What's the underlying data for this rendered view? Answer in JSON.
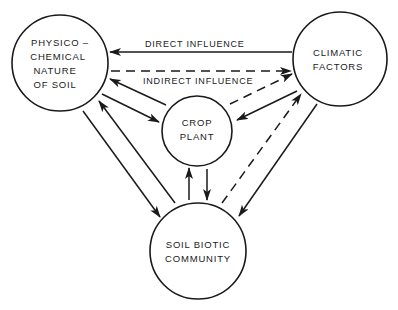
{
  "diagram": {
    "nodes": {
      "soil": {
        "lines": [
          "PHYSICO –",
          "CHEMICAL",
          "NATURE",
          "OF SOIL"
        ]
      },
      "climate": {
        "lines": [
          "CLIMATIC",
          "FACTORS"
        ]
      },
      "crop": {
        "lines": [
          "CROP",
          "PLANT"
        ]
      },
      "biotic": {
        "lines": [
          "SOIL BIOTIC",
          "COMMUNITY"
        ]
      }
    },
    "legend": {
      "direct": "DIRECT INFLUENCE",
      "indirect": "INDIRECT INFLUENCE"
    },
    "edges": [
      {
        "from": "climate",
        "to": "soil",
        "style": "solid",
        "label": "DIRECT INFLUENCE"
      },
      {
        "from": "soil",
        "to": "climate",
        "style": "dashed",
        "label": "INDIRECT INFLUENCE"
      },
      {
        "from": "crop",
        "to": "soil",
        "style": "solid"
      },
      {
        "from": "soil",
        "to": "crop",
        "style": "solid"
      },
      {
        "from": "crop",
        "to": "climate",
        "style": "dashed"
      },
      {
        "from": "climate",
        "to": "crop",
        "style": "solid"
      },
      {
        "from": "soil",
        "to": "biotic",
        "style": "solid"
      },
      {
        "from": "biotic",
        "to": "soil",
        "style": "solid"
      },
      {
        "from": "biotic",
        "to": "crop",
        "style": "solid"
      },
      {
        "from": "crop",
        "to": "biotic",
        "style": "solid"
      },
      {
        "from": "biotic",
        "to": "climate",
        "style": "dashed"
      },
      {
        "from": "climate",
        "to": "biotic",
        "style": "solid"
      }
    ]
  }
}
